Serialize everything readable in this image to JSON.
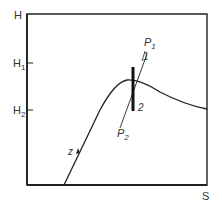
{
  "diagram": {
    "type": "enthalpy-entropy (Mollier) diagram",
    "axes": {
      "y_label": "H",
      "x_label": "S"
    },
    "ticks": {
      "h1": {
        "label": "H",
        "sub": "1"
      },
      "h2": {
        "label": "H",
        "sub": "2"
      }
    },
    "curve_label": "z",
    "isobars": {
      "p1": {
        "label": "P",
        "sub": "1"
      },
      "p2": {
        "label": "P",
        "sub": "2"
      }
    },
    "points": {
      "state1": "1",
      "state2": "2"
    },
    "colors": {
      "ink": "#222222",
      "background": "#ffffff"
    }
  }
}
